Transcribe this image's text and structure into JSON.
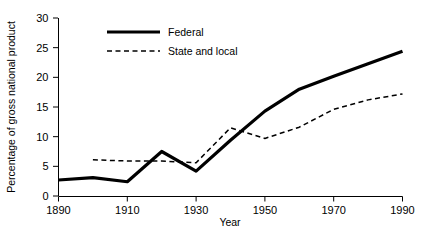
{
  "chart_data": {
    "type": "line",
    "title": "",
    "xlabel": "Year",
    "ylabel": "Percentage of gross national product",
    "x": [
      1890,
      1900,
      1910,
      1920,
      1930,
      1940,
      1950,
      1960,
      1970,
      1980,
      1990
    ],
    "xlim": [
      1890,
      1990
    ],
    "ylim": [
      0,
      30
    ],
    "xticks": [
      1890,
      1910,
      1930,
      1950,
      1970,
      1990
    ],
    "xtick_labels": [
      "1890",
      "1910",
      "1930",
      "1950",
      "1970",
      "1990"
    ],
    "yticks": [
      0,
      5,
      10,
      15,
      20,
      25,
      30
    ],
    "ytick_labels": [
      "0",
      "5",
      "10",
      "15",
      "20",
      "25",
      "30"
    ],
    "grid": false,
    "legend_position": "top-center",
    "series": [
      {
        "name": "Federal",
        "style": "solid",
        "color": "#000000",
        "x": [
          1890,
          1900,
          1910,
          1920,
          1930,
          1940,
          1950,
          1960,
          1970,
          1980,
          1990
        ],
        "values": [
          2.7,
          3.1,
          2.4,
          7.5,
          4.2,
          9.4,
          14.3,
          18.0,
          20.2,
          22.3,
          24.4
        ]
      },
      {
        "name": "State and local",
        "style": "dashed",
        "color": "#000000",
        "x": [
          1900,
          1910,
          1920,
          1930,
          1940,
          1950,
          1960,
          1970,
          1980,
          1990
        ],
        "values": [
          6.1,
          5.9,
          5.9,
          5.6,
          11.5,
          9.7,
          11.6,
          14.6,
          16.2,
          17.2
        ]
      }
    ]
  },
  "legend": {
    "items": [
      {
        "label": "Federal"
      },
      {
        "label": "State and local"
      }
    ]
  },
  "axes": {
    "x_title": "Year",
    "y_title": "Percentage of gross national product"
  }
}
